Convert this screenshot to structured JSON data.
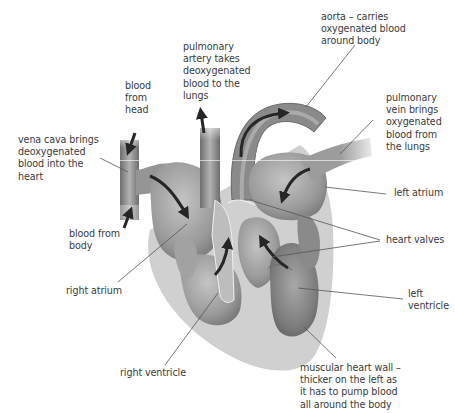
{
  "diagram": {
    "colors": {
      "background": "#ffffff",
      "heart_wall": "#cfcfcf",
      "chamber_light": "#a9a9a9",
      "chamber_dark": "#7d7d7d",
      "vessel": "#8e8e8e",
      "arrow": "#262626",
      "leader_line": "#555555",
      "text": "#3b3b3b"
    },
    "labels": [
      {
        "id": "aorta",
        "lines": [
          "aorta – carries",
          "oxygenated blood",
          "around body"
        ]
      },
      {
        "id": "pulmonary-artery",
        "lines": [
          "pulmonary",
          "artery takes",
          "deoxygenated",
          "blood to the",
          "lungs"
        ]
      },
      {
        "id": "blood-from-head",
        "lines": [
          "blood",
          "from",
          "head"
        ]
      },
      {
        "id": "pulmonary-vein",
        "lines": [
          "pulmonary",
          "vein brings",
          "oxygenated",
          "blood from",
          "the lungs"
        ]
      },
      {
        "id": "vena-cava",
        "lines": [
          "vena cava brings",
          "deoxygenated",
          "blood into the",
          "heart"
        ]
      },
      {
        "id": "left-atrium",
        "lines": [
          "left atrium"
        ]
      },
      {
        "id": "blood-from-body",
        "lines": [
          "blood from",
          "body"
        ]
      },
      {
        "id": "heart-valves",
        "lines": [
          "heart valves"
        ]
      },
      {
        "id": "right-atrium",
        "lines": [
          "right atrium"
        ]
      },
      {
        "id": "left-ventricle",
        "lines": [
          "left",
          "ventricle"
        ]
      },
      {
        "id": "right-ventricle",
        "lines": [
          "right ventricle"
        ]
      },
      {
        "id": "muscular-wall",
        "lines": [
          "muscular heart wall –",
          "thicker on the left as",
          "it has to pump blood",
          "all around the body"
        ]
      }
    ]
  }
}
